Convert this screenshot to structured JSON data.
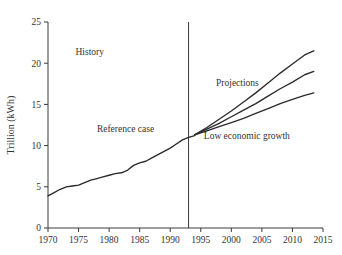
{
  "chart_data": {
    "type": "line",
    "title": "",
    "xlabel": "",
    "ylabel": "Trillion (kWh)",
    "xlim": [
      1970,
      2015
    ],
    "ylim": [
      0,
      25
    ],
    "grid": false,
    "legend": "none",
    "xticks": [
      "1970",
      "1975",
      "1980",
      "1985",
      "1990",
      "1995",
      "2000",
      "2005",
      "2010",
      "2015"
    ],
    "xtick_values": [
      1970,
      1975,
      1980,
      1985,
      1990,
      1995,
      2000,
      2005,
      2010,
      2015
    ],
    "yticks": [
      "0",
      "5",
      "10",
      "15",
      "20",
      "25"
    ],
    "ytick_values": [
      0,
      5,
      10,
      15,
      20,
      25
    ],
    "annotations": [
      {
        "text": "History",
        "x": 1974.5,
        "y": 21.0
      },
      {
        "text": "Reference case",
        "x": 1978.0,
        "y": 11.6
      },
      {
        "text": "Projections",
        "x": 1997.5,
        "y": 17.2
      },
      {
        "text": "Low economic growth",
        "x": 1995.5,
        "y": 10.8
      }
    ],
    "divider": {
      "x": 1993,
      "label": "history-projection divider",
      "y_from": 0,
      "y_to": 25
    },
    "series": [
      {
        "name": "History (Reference case)",
        "segment": "history",
        "x": [
          1970,
          1971,
          1972,
          1973,
          1974,
          1975,
          1976,
          1977,
          1978,
          1979,
          1980,
          1981,
          1982,
          1983,
          1984,
          1985,
          1986,
          1987,
          1988,
          1989,
          1990,
          1991,
          1992,
          1993,
          1994
        ],
        "values": [
          3.9,
          4.3,
          4.7,
          5.0,
          5.1,
          5.2,
          5.5,
          5.8,
          6.0,
          6.2,
          6.4,
          6.6,
          6.7,
          7.0,
          7.6,
          7.9,
          8.1,
          8.5,
          8.9,
          9.3,
          9.7,
          10.2,
          10.7,
          11.0,
          11.2
        ],
        "style": "solid"
      },
      {
        "name": "High growth projection",
        "segment": "projection",
        "x": [
          1994,
          1996,
          1998,
          2000,
          2002,
          2004,
          2006,
          2008,
          2010,
          2012,
          2013.5
        ],
        "values": [
          11.3,
          12.2,
          13.2,
          14.2,
          15.3,
          16.4,
          17.6,
          18.8,
          19.9,
          21.0,
          21.5
        ],
        "style": "solid"
      },
      {
        "name": "Reference case projection",
        "segment": "projection",
        "x": [
          1994,
          1996,
          1998,
          2000,
          2002,
          2004,
          2006,
          2008,
          2010,
          2012,
          2013.5
        ],
        "values": [
          11.3,
          12.0,
          12.7,
          13.5,
          14.3,
          15.1,
          16.0,
          16.9,
          17.7,
          18.6,
          19.0
        ],
        "style": "solid"
      },
      {
        "name": "Low economic growth projection",
        "segment": "projection",
        "x": [
          1994,
          1996,
          1998,
          2000,
          2002,
          2004,
          2006,
          2008,
          2010,
          2012,
          2013.5
        ],
        "values": [
          11.3,
          11.8,
          12.3,
          12.8,
          13.3,
          13.9,
          14.5,
          15.1,
          15.6,
          16.1,
          16.4
        ],
        "style": "solid"
      }
    ]
  }
}
